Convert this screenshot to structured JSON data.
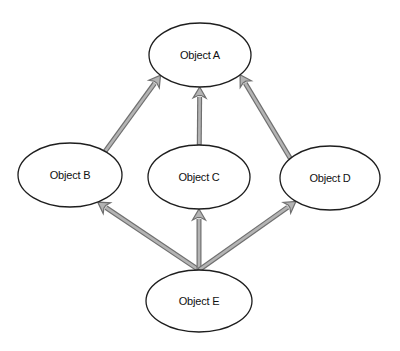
{
  "diagram": {
    "type": "directed-graph",
    "nodes": [
      {
        "id": "A",
        "label": "Object A"
      },
      {
        "id": "B",
        "label": "Object B"
      },
      {
        "id": "C",
        "label": "Object C"
      },
      {
        "id": "D",
        "label": "Object D"
      },
      {
        "id": "E",
        "label": "Object E"
      }
    ],
    "edges": [
      {
        "from": "B",
        "to": "A"
      },
      {
        "from": "C",
        "to": "A"
      },
      {
        "from": "D",
        "to": "A"
      },
      {
        "from": "E",
        "to": "B"
      },
      {
        "from": "E",
        "to": "C"
      },
      {
        "from": "E",
        "to": "D"
      }
    ],
    "colors": {
      "node_fill": "#ffffff",
      "node_stroke": "#1e1e1e",
      "edge_fill": "#b4b4b4",
      "edge_outline": "#6f6f6f",
      "text": "#111111"
    }
  }
}
